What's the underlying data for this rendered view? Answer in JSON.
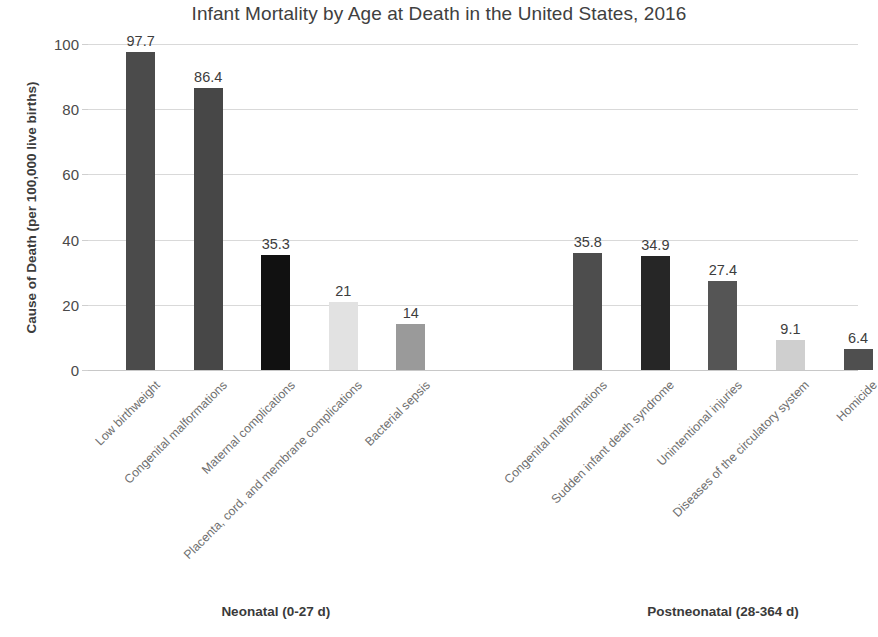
{
  "chart_data": {
    "type": "bar",
    "title": "Infant Mortality by Age at Death in the United States, 2016",
    "xlabel": "",
    "ylabel": "Cause of Death (per 100,000 live births)",
    "ylim": [
      0,
      100
    ],
    "yticks": [
      "0",
      "20",
      "40",
      "60",
      "80",
      "100"
    ],
    "ytick_values": [
      0,
      20,
      40,
      60,
      80,
      100
    ],
    "grid": "horizontal",
    "legend": "none",
    "categories": [
      "Low birthweight",
      "Congenital malformations",
      "Maternal complications",
      "Placenta, cord, and membrane complications",
      "Bacterial sepsis",
      "Congenital malformations",
      "Sudden infant death syndrome",
      "Unintentional injuries",
      "Diseases of the circulatory system",
      "Homicide"
    ],
    "values": [
      97.7,
      86.4,
      35.3,
      21,
      14,
      35.8,
      34.9,
      27.4,
      9.1,
      6.4
    ],
    "value_labels": [
      "97.7",
      "86.4",
      "35.3",
      "21",
      "14",
      "35.8",
      "34.9",
      "27.4",
      "9.1",
      "6.4"
    ],
    "bar_colors": [
      "#4b4b4b",
      "#474747",
      "#111111",
      "#e2e2e2",
      "#9a9a9a",
      "#4d4d4d",
      "#262626",
      "#555555",
      "#cfcfcf",
      "#4f4f4f"
    ],
    "groups": [
      {
        "label": "Neonatal (0-27 d)",
        "start_index": 0,
        "end_index": 4
      },
      {
        "label": "Postneonatal (28-364 d)",
        "start_index": 5,
        "end_index": 9
      }
    ],
    "colors": {
      "background": "#ffffff",
      "title_text": "#404040",
      "axis_text": "#4a4a4a",
      "category_text": "#6f6f6f",
      "gridline": "#d9d9d9",
      "baseline": "#c8c8c8"
    }
  }
}
